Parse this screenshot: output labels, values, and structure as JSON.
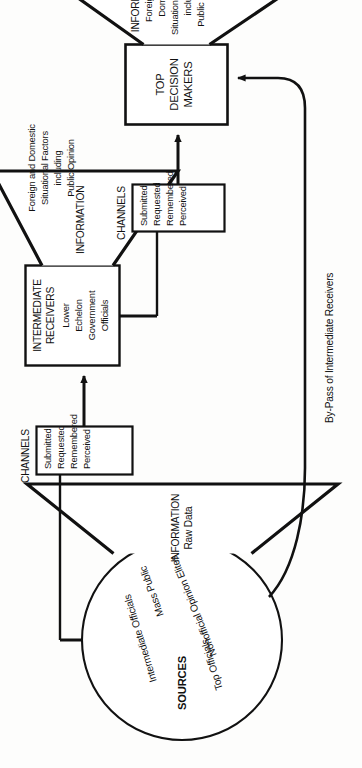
{
  "diagram": {
    "orientation_note": "rotated 90 degrees",
    "stroke_color": "#111111",
    "background_color": "#fdfdfc"
  },
  "sources": {
    "shape_label": "SOURCES",
    "items": [
      "Top Officials",
      "Intermediate Officials",
      "Nonofficial Opinion Elites",
      "Mass Public"
    ]
  },
  "information_raw": {
    "heading": "INFORMATION",
    "subheading": "Raw Data"
  },
  "channels_lower": {
    "heading": "CHANNELS",
    "items": [
      "Submitted",
      "Requested",
      "Remembered",
      "Perceived"
    ]
  },
  "intermediate_receivers": {
    "heading_line1": "INTERMEDIATE",
    "heading_line2": "RECEIVERS",
    "detail": [
      "Lower",
      "Echelon",
      "Government",
      "Officials"
    ]
  },
  "information_middle": {
    "heading": "INFORMATION",
    "lines": [
      "Foreign and Domestic",
      "Situational Factors",
      "including",
      "Public Opinion"
    ]
  },
  "channels_upper": {
    "heading": "CHANNELS",
    "items": [
      "Submitted",
      "Requested",
      "Remembered",
      "Perceived"
    ]
  },
  "top_decision_makers": {
    "line1": "TOP",
    "line2": "DECISION",
    "line3": "MAKERS"
  },
  "information_top": {
    "heading": "INFORMATION",
    "lines": [
      "Foreign and",
      "Domestic",
      "Situational Factors",
      "including",
      "Public Opinion"
    ]
  },
  "bypass": {
    "label": "By-Pass of Intermediate Receivers"
  }
}
